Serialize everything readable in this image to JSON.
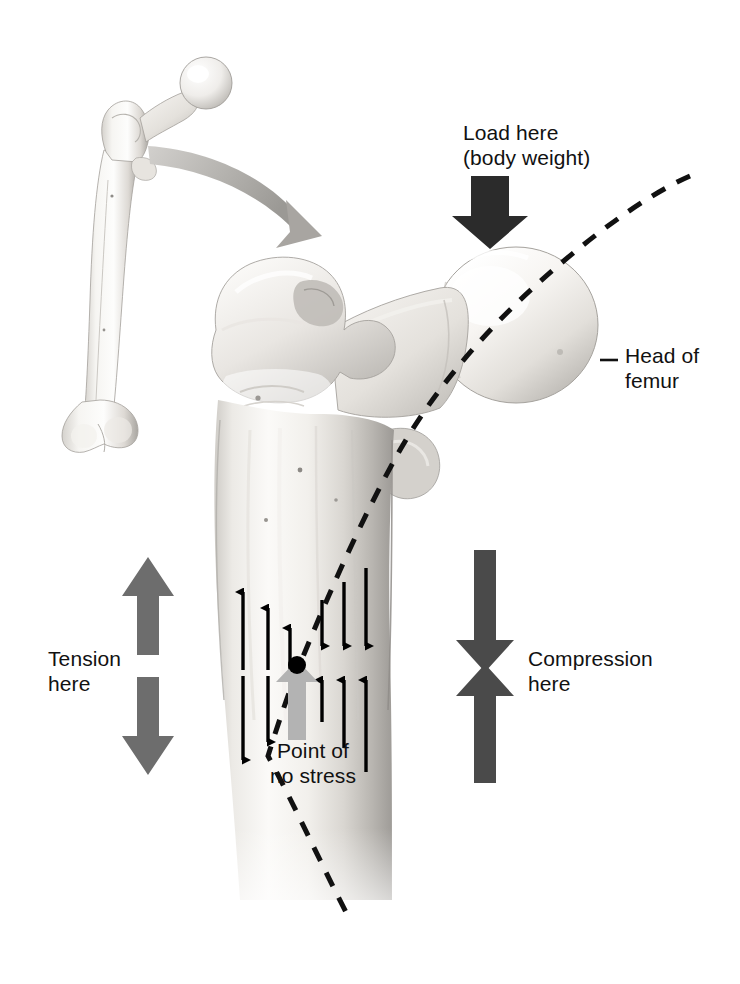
{
  "labels": {
    "load_line1": "Load here",
    "load_line2": "(body weight)",
    "head_line1": "Head of",
    "head_line2": "femur",
    "tension_line1": "Tension",
    "tension_line2": "here",
    "compression_line1": "Compression",
    "compression_here": "here",
    "nostress_line1": "Point of",
    "nostress_line2": "no stress"
  },
  "colors": {
    "load_arrow": "#2b2b2b",
    "tension_arrow": "#6d6d6d",
    "compression_arrow": "#4a4a4a",
    "zoom_arrow": "#a8a8a8",
    "neutral_axis": "#111111",
    "stress_arrow": "#000000",
    "pointer_arrow": "#b3b3b3",
    "bone_light": "#fdfdfc",
    "bone_mid": "#d8d6d2",
    "bone_shadow": "#9e9c98",
    "text": "#111111",
    "background": "#ffffff"
  },
  "stress_field": {
    "neutral_point": {
      "x": 296,
      "y": 665
    },
    "tension_side": "left (medial shaft edge = lateral cortex)",
    "compression_side": "right",
    "above_neutral_left": [
      {
        "x": 243,
        "len": 78,
        "dir": "up"
      },
      {
        "x": 268,
        "len": 62,
        "dir": "up"
      },
      {
        "x": 290,
        "len": 42,
        "dir": "up"
      }
    ],
    "above_neutral_right": [
      {
        "x": 322,
        "len": 42,
        "dir": "down"
      },
      {
        "x": 344,
        "len": 62,
        "dir": "down"
      },
      {
        "x": 366,
        "len": 78,
        "dir": "down"
      }
    ],
    "below_neutral_left": [
      {
        "x": 243,
        "len": 78,
        "dir": "down"
      },
      {
        "x": 268,
        "len": 62,
        "dir": "down"
      },
      {
        "x": 290,
        "len": 42,
        "dir": "down"
      }
    ],
    "below_neutral_right": [
      {
        "x": 322,
        "len": 42,
        "dir": "up"
      },
      {
        "x": 344,
        "len": 62,
        "dir": "up"
      },
      {
        "x": 366,
        "len": 78,
        "dir": "up"
      }
    ]
  },
  "annotations": {
    "load_arrow": {
      "direction": "down",
      "x": 489,
      "top": 176,
      "bottom": 243
    },
    "tension_arrow": {
      "direction": "double-outward",
      "x": 148,
      "top": 557,
      "bottom": 775
    },
    "compression_arrow": {
      "direction": "double-inward",
      "x": 485,
      "top": 550,
      "bottom": 783
    },
    "zoom_arrow": {
      "from": "inset femur",
      "to": "magnified proximal femur",
      "style": "curved gray"
    },
    "neutral_axis": {
      "style": "dashed",
      "from": "upper right above head",
      "to": "lower shaft"
    }
  }
}
